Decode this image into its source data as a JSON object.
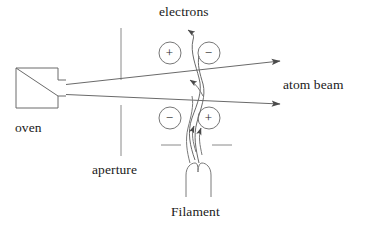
{
  "figure": {
    "background_color": "#ffffff",
    "line_color": "#555555",
    "text_color": "#1a1a1a",
    "width": 366,
    "height": 226
  },
  "labels": {
    "electrons": "electrons",
    "atom_beam": "atom beam",
    "oven": "oven",
    "aperture": "aperture",
    "filament": "Filament"
  },
  "charges": {
    "top_left": "+",
    "top_right": "−",
    "bottom_left": "−",
    "bottom_right": "+"
  },
  "components": {
    "oven_box": {
      "x": 16,
      "y": 68,
      "width": 42,
      "height": 40
    },
    "nozzle": {
      "x": 58,
      "y": 80,
      "width": 8,
      "height": 16
    },
    "aperture_upper": {
      "x": 121,
      "y1": 28,
      "y2": 80
    },
    "aperture_lower": {
      "x": 121,
      "y1": 105,
      "y2": 156
    },
    "dash_left": {
      "x1": 161,
      "x2": 181,
      "y": 145
    },
    "dash_right": {
      "x1": 212,
      "x2": 232,
      "y": 145
    },
    "charge_circle_radius": 11,
    "charge_positions": [
      {
        "cx": 170,
        "cy": 53,
        "sign": "+"
      },
      {
        "cx": 209,
        "cy": 53,
        "sign": "−"
      },
      {
        "cx": 170,
        "cy": 118,
        "sign": "−"
      },
      {
        "cx": 209,
        "cy": 118,
        "sign": "+"
      }
    ],
    "beam_upper": {
      "x1": 66,
      "y1": 85,
      "x2": 286,
      "y2": 61
    },
    "beam_lower": {
      "x1": 66,
      "y1": 94,
      "x2": 286,
      "y2": 104
    },
    "filament_hairpin": {
      "x": 185,
      "y": 165,
      "width": 26,
      "height": 32
    }
  }
}
